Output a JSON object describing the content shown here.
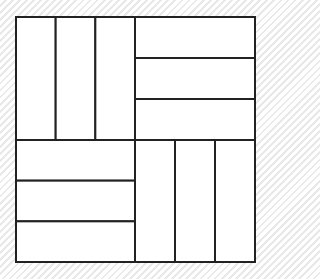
{
  "diagram": {
    "title": "",
    "quadrants": [
      {
        "name": "top-left",
        "orientation": "vertical",
        "strips": 3
      },
      {
        "name": "top-right",
        "orientation": "horizontal",
        "strips": 3
      },
      {
        "name": "bottom-left",
        "orientation": "horizontal",
        "strips": 3
      },
      {
        "name": "bottom-right",
        "orientation": "vertical",
        "strips": 3
      }
    ],
    "colors": {
      "fill": "#ffffff",
      "stroke": "#222222"
    }
  }
}
